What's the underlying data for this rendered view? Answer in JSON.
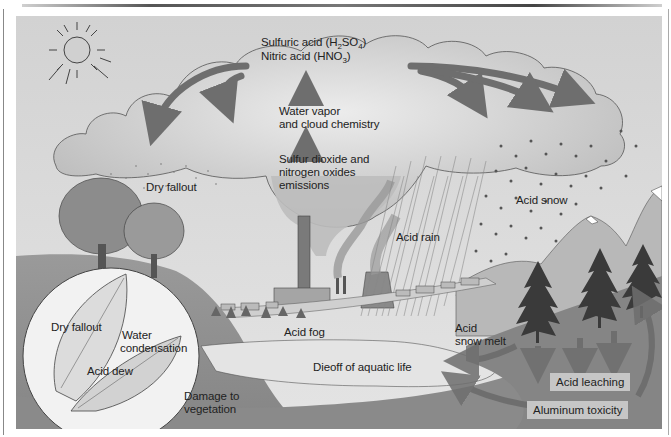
{
  "diagram": {
    "colors": {
      "sky": "#dcdcdc",
      "cloud": "#cfcfcf",
      "cloud_outline": "#555555",
      "arrow": "#6e6e6e",
      "ground": "#8f8f8f",
      "ground_dark": "#7a7a7a",
      "hill_light": "#d8d8d8",
      "lake": "#e6e6e6",
      "label_box": "#c6c6c6",
      "text": "#222222"
    },
    "labels": {
      "sulfuric_acid": "Sulfuric acid (H",
      "sulfuric_sub1": "2",
      "sulfuric_mid": "SO",
      "sulfuric_sub2": "4",
      "sulfuric_end": ")",
      "nitric_acid": "Nitric acid (HNO",
      "nitric_sub": "3",
      "nitric_end": ")",
      "water_vapor_line1": "Water vapor",
      "water_vapor_line2": "and cloud chemistry",
      "emissions_line1": "Sulfur dioxide and",
      "emissions_line2": "nitrogen oxides",
      "emissions_line3": "emissions",
      "dry_fallout": "Dry fallout",
      "acid_snow": "Acid snow",
      "acid_rain": "Acid rain",
      "acid_fog": "Acid fog",
      "acid_snow_melt_line1": "Acid",
      "acid_snow_melt_line2": "snow melt",
      "dieoff": "Dieoff of aquatic life",
      "acid_leaching": "Acid leaching",
      "aluminum_toxicity": "Aluminum toxicity",
      "damage_line1": "Damage to",
      "damage_line2": "vegetation"
    },
    "inset": {
      "dry_fallout": "Dry fallout",
      "water_line1": "Water",
      "water_line2": "condensation",
      "acid_dew": "Acid dew"
    }
  }
}
